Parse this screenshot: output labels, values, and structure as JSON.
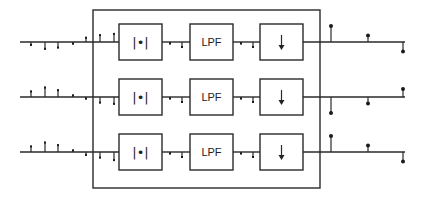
{
  "diagram": {
    "title": "",
    "blocks": [
      {
        "id": "magnitude",
        "label": "|•|",
        "meaning": "absolute value"
      },
      {
        "id": "lpf",
        "label": "LPF",
        "meaning": "low-pass filter"
      },
      {
        "id": "downsample",
        "label": "↓",
        "meaning": "downsampling"
      }
    ],
    "channels": [
      {
        "name": "channel-1",
        "input_samples": [
          -0.3,
          -0.6,
          -0.5,
          -0.2,
          0.4,
          0.6,
          0.7
        ],
        "after_magnitude": [
          -0.2,
          -0.5
        ],
        "after_lpf": [
          -0.2,
          -0.5
        ],
        "output_samples": [
          1.0,
          0.4,
          -0.6
        ]
      },
      {
        "name": "channel-2",
        "input_samples": [
          0.5,
          0.8,
          0.6,
          0.2,
          -0.2,
          -0.5,
          -0.6
        ],
        "after_magnitude": [
          -0.2,
          -0.5
        ],
        "after_lpf": [
          -0.2,
          -0.5
        ],
        "output_samples": [
          -1.0,
          -0.4,
          0.5
        ]
      },
      {
        "name": "channel-3",
        "input_samples": [
          0.5,
          0.8,
          0.6,
          0.2,
          -0.3,
          -0.5,
          -0.7
        ],
        "after_magnitude": [
          -0.2,
          -0.5
        ],
        "after_lpf": [
          -0.2,
          -0.5
        ],
        "output_samples": [
          1.0,
          0.4,
          -0.6
        ]
      }
    ]
  }
}
